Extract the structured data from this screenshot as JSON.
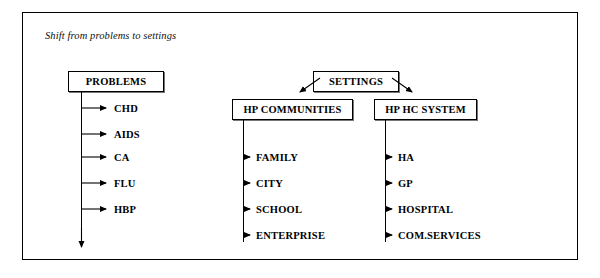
{
  "caption": "Shift from problems to settings",
  "nodes": {
    "problems": "PROBLEMS",
    "settings": "SETTINGS",
    "hp_communities": "HP COMMUNITIES",
    "hp_hc_system": "HP HC SYSTEM"
  },
  "branches": {
    "problems_items": [
      "CHD",
      "AIDS",
      "CA",
      "FLU",
      "HBP"
    ],
    "communities_items": [
      "FAMILY",
      "CITY",
      "SCHOOL",
      "ENTERPRISE"
    ],
    "system_items": [
      "HA",
      "GP",
      "HOSPITAL",
      "COM.SERVICES"
    ]
  },
  "colors": {
    "ink": "#000000",
    "background": "#ffffff",
    "shadow": "#777777"
  }
}
